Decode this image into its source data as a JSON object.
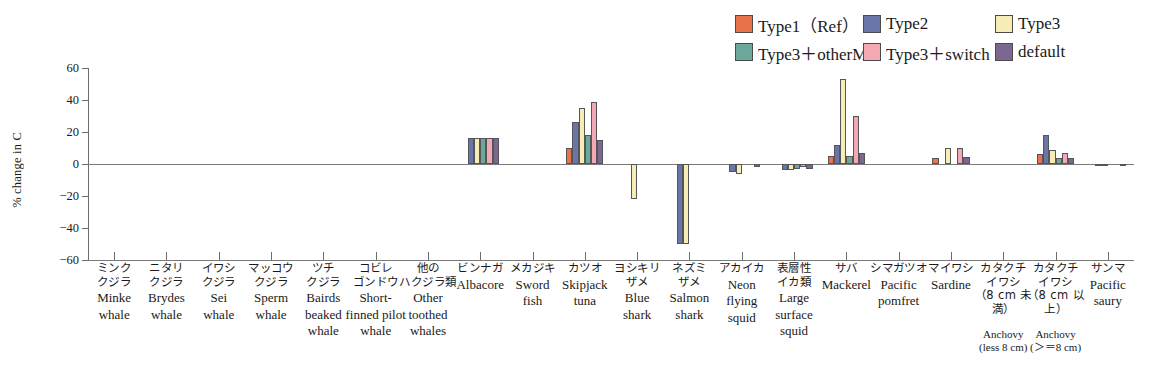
{
  "chart_data": {
    "type": "bar",
    "title": "",
    "xlabel": "",
    "ylabel": "% change in C",
    "ylim": [
      -60,
      60
    ],
    "yticks": [
      60,
      40,
      20,
      0,
      -20,
      -40,
      -60
    ],
    "ytick_labels": [
      "60",
      "40",
      "20",
      "0",
      "−20",
      "−40",
      "−60"
    ],
    "grid": false,
    "legend_position": "top-right",
    "categories": [
      "Minke whale",
      "Brydes whale",
      "Sei whale",
      "Sperm whale",
      "Bairds beaked whale",
      "Short-finned pilot whale",
      "Other toothed whales",
      "Albacore",
      "Sword fish",
      "Skipjack tuna",
      "Blue shark",
      "Salmon shark",
      "Neon flying squid",
      "Large surface squid",
      "Mackerel",
      "Pacific pomfret",
      "Sardine",
      "Anchovy (less 8 cm)",
      "Anchovy (>=8 cm)",
      "Pacific saury"
    ],
    "series": [
      {
        "name": "Type1 (Ref)",
        "color": "#e8734a",
        "values": [
          0,
          0,
          0,
          0,
          0,
          0,
          0,
          0,
          0,
          10,
          0,
          0,
          0,
          0,
          5,
          0,
          4,
          0,
          6,
          0
        ]
      },
      {
        "name": "Type2",
        "color": "#6b76a8",
        "values": [
          0,
          0,
          0,
          0,
          0,
          0,
          0,
          16.5,
          0,
          26,
          0,
          -50,
          -5,
          -4,
          12,
          0,
          0,
          0,
          18,
          -1
        ]
      },
      {
        "name": "Type3",
        "color": "#f5edb3",
        "values": [
          0,
          0,
          0,
          0,
          0,
          0,
          0,
          16.5,
          0,
          35,
          -22,
          -50,
          -6,
          -4,
          53,
          0,
          10,
          0,
          9,
          -1
        ]
      },
      {
        "name": "Type3 + otherM",
        "color": "#6aa89a",
        "values": [
          0,
          0,
          0,
          0,
          0,
          0,
          0,
          16.5,
          0,
          18,
          0,
          0,
          0,
          -3,
          5,
          0,
          0,
          0,
          4,
          0
        ]
      },
      {
        "name": "Type3 + switch",
        "color": "#f2a9b4",
        "values": [
          0,
          0,
          0,
          0,
          0,
          0,
          0,
          16.5,
          0,
          39,
          0,
          0,
          0,
          -2,
          30,
          0,
          10,
          0,
          7,
          0
        ]
      },
      {
        "name": "default",
        "color": "#7d6790",
        "values": [
          0,
          0,
          0,
          0,
          0,
          0,
          0,
          16.5,
          0,
          15,
          0,
          0,
          -2,
          -3,
          7,
          0,
          4.5,
          0,
          4,
          -1.5
        ]
      }
    ]
  },
  "legend": {
    "items": [
      {
        "label": "Type1（Ref）",
        "color": "#e8734a",
        "name": "type1-ref"
      },
      {
        "label": "Type2",
        "color": "#6b76a8",
        "name": "type2"
      },
      {
        "label": "Type3",
        "color": "#f5edb3",
        "name": "type3"
      },
      {
        "label": "Type3＋otherM",
        "color": "#6aa89a",
        "name": "type3-otherm"
      },
      {
        "label": "Type3＋switch",
        "color": "#f2a9b4",
        "name": "type3-switch"
      },
      {
        "label": "default",
        "color": "#7d6790",
        "name": "default"
      }
    ]
  },
  "axis": {
    "y_label": "% change in C"
  },
  "categories_detail": [
    {
      "jp": [
        "ミンク",
        "クジラ"
      ],
      "en": [
        "Minke",
        "whale"
      ],
      "sub": []
    },
    {
      "jp": [
        "ニタリ",
        "クジラ"
      ],
      "en": [
        "Brydes",
        "whale"
      ],
      "sub": []
    },
    {
      "jp": [
        "イワシ",
        "クジラ"
      ],
      "en": [
        "Sei",
        "whale"
      ],
      "sub": []
    },
    {
      "jp": [
        "マッコウ",
        "クジラ"
      ],
      "en": [
        "Sperm",
        "whale"
      ],
      "sub": []
    },
    {
      "jp": [
        "ツチ",
        "クジラ"
      ],
      "en": [
        "Bairds",
        "beaked",
        "whale"
      ],
      "sub": []
    },
    {
      "jp": [
        "コビレ",
        "ゴンドウ"
      ],
      "en": [
        "Short-",
        "finned pilot",
        "whale"
      ],
      "sub": []
    },
    {
      "jp": [
        "他の",
        "ハクジラ類"
      ],
      "en": [
        "Other",
        "toothed",
        "whales"
      ],
      "sub": []
    },
    {
      "jp": [
        "ビンナガ"
      ],
      "en": [
        "Albacore"
      ],
      "sub": []
    },
    {
      "jp": [
        "メカジキ"
      ],
      "en": [
        "Sword",
        "fish"
      ],
      "sub": []
    },
    {
      "jp": [
        "カツオ"
      ],
      "en": [
        "Skipjack",
        "tuna"
      ],
      "sub": []
    },
    {
      "jp": [
        "ヨシキリ",
        "ザメ"
      ],
      "en": [
        "Blue",
        "shark"
      ],
      "sub": []
    },
    {
      "jp": [
        "ネズミ",
        "ザメ"
      ],
      "en": [
        "Salmon",
        "shark"
      ],
      "sub": []
    },
    {
      "jp": [
        "アカイカ"
      ],
      "en": [
        "Neon",
        "flying",
        "squid"
      ],
      "sub": []
    },
    {
      "jp": [
        "表層性",
        "イカ類"
      ],
      "en": [
        "Large",
        "surface",
        "squid"
      ],
      "sub": []
    },
    {
      "jp": [
        "サバ"
      ],
      "en": [
        "Mackerel"
      ],
      "sub": []
    },
    {
      "jp": [
        "シマガツオ"
      ],
      "en": [
        "Pacific",
        "pomfret"
      ],
      "sub": []
    },
    {
      "jp": [
        "マイワシ"
      ],
      "en": [
        "Sardine"
      ],
      "sub": []
    },
    {
      "jp": [
        "カタクチ",
        "イワシ",
        "（8 cm 未満）"
      ],
      "en": [],
      "sub": [
        "Anchovy",
        "(less 8 cm)"
      ]
    },
    {
      "jp": [
        "カタクチ",
        "イワシ",
        "（8 cm 以上）"
      ],
      "en": [],
      "sub": [
        "Anchovy",
        "(＞＝8 cm)"
      ]
    },
    {
      "jp": [
        "サンマ"
      ],
      "en": [
        "Pacific",
        "saury"
      ],
      "sub": []
    }
  ]
}
